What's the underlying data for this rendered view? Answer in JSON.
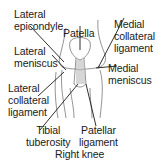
{
  "diagram": {
    "title": "Right knee",
    "labels": {
      "lateral_epicondyle": [
        "Lateral",
        "epicondyle"
      ],
      "patella": "Patella",
      "medial_collateral_ligament": [
        "Medial",
        "collateral",
        "ligament"
      ],
      "lateral_meniscus": [
        "Lateral",
        "meniscus"
      ],
      "medial_meniscus": [
        "Medial",
        "meniscus"
      ],
      "lateral_collateral_ligament": [
        "Lateral",
        "collateral",
        "ligament"
      ],
      "tibial_tuberosity": [
        "Tibial",
        "tuberosity"
      ],
      "patellar_ligament": [
        "Patellar",
        "ligament"
      ]
    },
    "colors": {
      "line": "#1a1a1a",
      "sketch": "#555555",
      "background": "#ffffff"
    }
  }
}
